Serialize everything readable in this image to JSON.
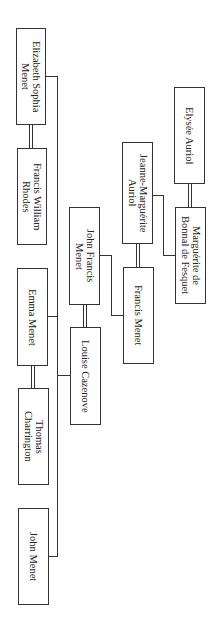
{
  "diagram": {
    "type": "family-tree",
    "orientation": "rotated-90",
    "persons": [
      {
        "id": "elizabeth",
        "name": "Elizabeth Sophia\nMenet"
      },
      {
        "id": "francis_w",
        "name": "Francis  William\nRhodes"
      },
      {
        "id": "john_francis",
        "name": "John Francis\nMenet"
      },
      {
        "id": "emma",
        "name": "Emma Menet"
      },
      {
        "id": "louise",
        "name": "Louise Cazenove"
      },
      {
        "id": "thomas",
        "name": "Thomas\nCharrington"
      },
      {
        "id": "john",
        "name": "John Menet"
      },
      {
        "id": "jeanne",
        "name": "Jeanne-Marguérite\nAuriol"
      },
      {
        "id": "francis_m",
        "name": "Francis Menet"
      },
      {
        "id": "elysee",
        "name": "Elysée Auriol"
      },
      {
        "id": "marguerite",
        "name": "Marguérite de\nBonnal de Fesquet"
      }
    ],
    "marriages": [
      [
        "elysee",
        "marguerite"
      ],
      [
        "jeanne",
        "francis_m"
      ],
      [
        "john_francis",
        "louise"
      ],
      [
        "elizabeth",
        "francis_w"
      ],
      [
        "emma",
        "thomas"
      ]
    ],
    "parent_child": [
      {
        "parents": [
          "elysee",
          "marguerite"
        ],
        "children": [
          "jeanne"
        ]
      },
      {
        "parents": [
          "jeanne",
          "francis_m"
        ],
        "children": [
          "john_francis"
        ]
      },
      {
        "parents": [
          "john_francis",
          "louise"
        ],
        "children": [
          "elizabeth",
          "emma",
          "john"
        ]
      }
    ]
  }
}
